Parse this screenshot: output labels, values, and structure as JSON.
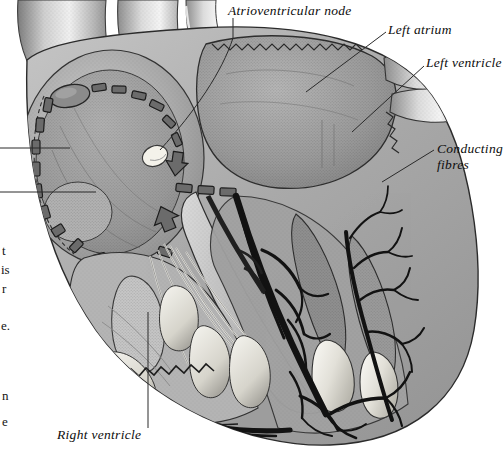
{
  "figure": {
    "kind": "anatomical-illustration",
    "style": "grayscale stipple-and-line engraving on white background",
    "width": 503,
    "height": 453,
    "background_color": "#ffffff",
    "body_color": "#a8a8a8",
    "ink_color": "#111111",
    "highlight_color": "#f2f0ea"
  },
  "labels": [
    {
      "id": "av-node",
      "text": "Atrioventricular node",
      "lines": [
        "Atrioventricular node"
      ]
    },
    {
      "id": "left-atrium",
      "text": "Left atrium",
      "lines": [
        "Left atrium"
      ]
    },
    {
      "id": "left-ventricle",
      "text": "Left ventricle",
      "lines": [
        "Left ventricle"
      ]
    },
    {
      "id": "conducting-fibres",
      "text": "Conducting fibres",
      "lines": [
        "Conducting",
        "fibres"
      ]
    },
    {
      "id": "right-ventricle",
      "text": "Right ventricle",
      "lines": [
        "Right ventricle"
      ]
    }
  ],
  "label_text": {
    "av_node": "Atrioventricular node",
    "left_atrium": "Left atrium",
    "left_ventricle": "Left ventricle",
    "conducting_line1": "Conducting",
    "conducting_line2": "fibres",
    "right_ventricle": "Right ventricle"
  },
  "page_text_fragments": {
    "note": "clipped line-endings of body text from the facing page, cut off at the left margin",
    "items": [
      "t",
      "is",
      "r",
      "e.",
      "n",
      "e"
    ]
  },
  "anatomy_parts": [
    "superior vena cava",
    "aorta",
    "right atrium",
    "left atrium",
    "right ventricle",
    "left ventricle",
    "interventricular septum",
    "sinoatrial node",
    "atrioventricular node",
    "internodal conduction pathway",
    "atrioventricular bundle",
    "papillary muscle",
    "chordae tendineae",
    "purkinje conducting fibres"
  ]
}
